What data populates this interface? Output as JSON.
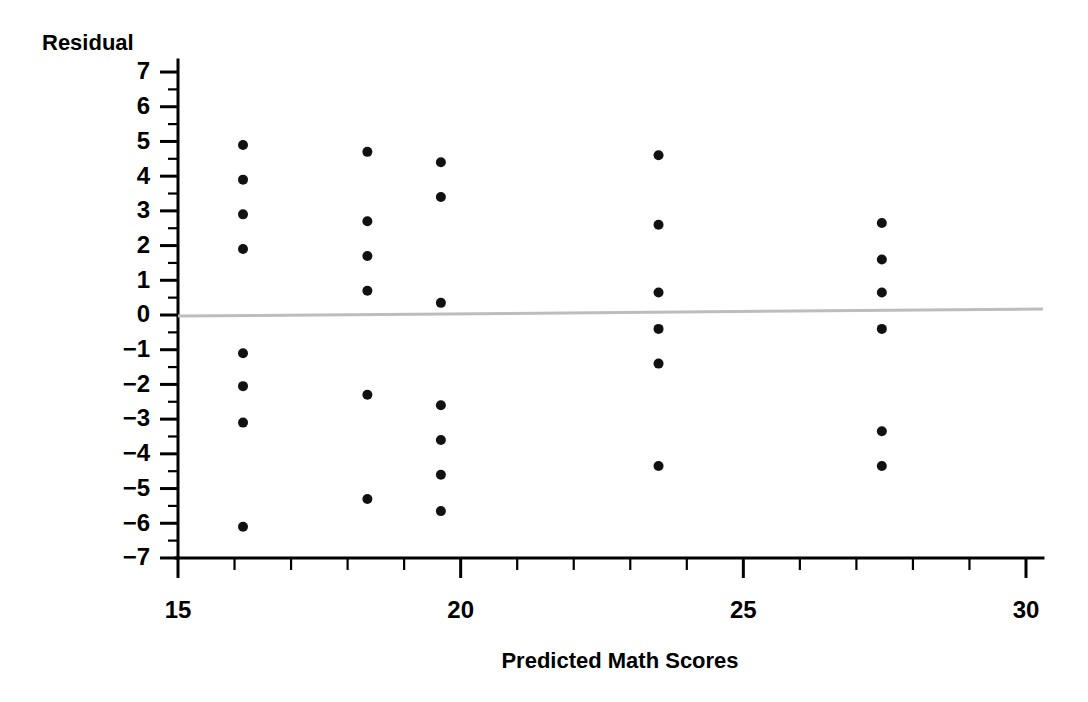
{
  "chart_data": {
    "type": "scatter",
    "title": "",
    "xlabel": "Predicted Math Scores",
    "ylabel": "Residual",
    "xlim": [
      15,
      30.3
    ],
    "ylim": [
      -7,
      7.35
    ],
    "grid": false,
    "legend": false,
    "x_ticks": [
      15,
      16,
      17,
      18,
      19,
      20,
      21,
      22,
      23,
      24,
      25,
      26,
      27,
      28,
      29,
      30
    ],
    "x_tick_labels": [
      "15",
      "",
      "",
      "",
      "",
      "20",
      "",
      "",
      "",
      "",
      "25",
      "",
      "",
      "",
      "",
      "30"
    ],
    "y_ticks": [
      -7,
      -6,
      -5,
      -4,
      -3,
      -2,
      -1,
      0,
      1,
      2,
      3,
      4,
      5,
      6,
      7
    ],
    "y_tick_labels": [
      "−7",
      "−6",
      "−5",
      "−4",
      "−3",
      "−2",
      "−1",
      "0",
      "1",
      "2",
      "3",
      "4",
      "5",
      "6",
      "7"
    ],
    "y_minor_ticks": [
      -6.5,
      -5.5,
      -4.5,
      -3.5,
      -2.5,
      -1.5,
      -0.5,
      0.5,
      1.5,
      2.5,
      3.5,
      4.5,
      5.5,
      6.5
    ],
    "marker": "circle",
    "marker_color": "#111111",
    "marker_size": 5,
    "reference_line": {
      "name": "zero-residual-line",
      "color": "#bdbdbd",
      "x_start": 15,
      "y_start": -0.03,
      "x_end": 30.3,
      "y_end": 0.17
    },
    "points": [
      {
        "x": 16.15,
        "y": 4.9
      },
      {
        "x": 16.15,
        "y": 3.9
      },
      {
        "x": 16.15,
        "y": 2.9
      },
      {
        "x": 16.15,
        "y": 1.9
      },
      {
        "x": 16.15,
        "y": -1.1
      },
      {
        "x": 16.15,
        "y": -2.05
      },
      {
        "x": 16.15,
        "y": -3.1
      },
      {
        "x": 16.15,
        "y": -6.1
      },
      {
        "x": 18.35,
        "y": 4.7
      },
      {
        "x": 18.35,
        "y": 2.7
      },
      {
        "x": 18.35,
        "y": 1.7
      },
      {
        "x": 18.35,
        "y": 0.7
      },
      {
        "x": 18.35,
        "y": -2.3
      },
      {
        "x": 18.35,
        "y": -5.3
      },
      {
        "x": 19.65,
        "y": 4.4
      },
      {
        "x": 19.65,
        "y": 3.4
      },
      {
        "x": 19.65,
        "y": 0.35
      },
      {
        "x": 19.65,
        "y": -2.6
      },
      {
        "x": 19.65,
        "y": -3.6
      },
      {
        "x": 19.65,
        "y": -4.6
      },
      {
        "x": 19.65,
        "y": -5.65
      },
      {
        "x": 23.5,
        "y": 4.6
      },
      {
        "x": 23.5,
        "y": 2.6
      },
      {
        "x": 23.5,
        "y": 0.65
      },
      {
        "x": 23.5,
        "y": -0.4
      },
      {
        "x": 23.5,
        "y": -1.4
      },
      {
        "x": 23.5,
        "y": -4.35
      },
      {
        "x": 27.45,
        "y": 2.65
      },
      {
        "x": 27.45,
        "y": 1.6
      },
      {
        "x": 27.45,
        "y": 0.65
      },
      {
        "x": 27.45,
        "y": -0.4
      },
      {
        "x": 27.45,
        "y": -3.35
      },
      {
        "x": 27.45,
        "y": -4.35
      }
    ]
  }
}
